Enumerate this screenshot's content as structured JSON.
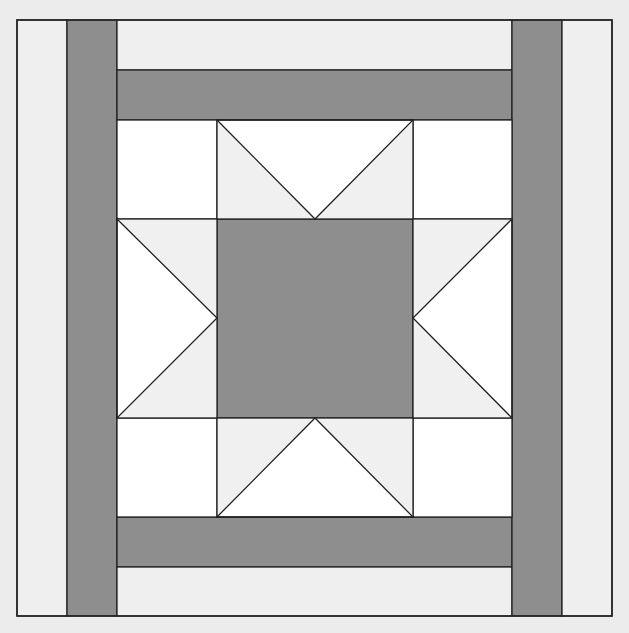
{
  "diagram": {
    "colors": {
      "page_background": "#ececec",
      "light_strip": "#efefef",
      "dark": "#8e8e8e",
      "white": "#ffffff",
      "star_point_light": "#f0f0f0",
      "outline": "#222222"
    },
    "block": {
      "x": 17,
      "y": 20,
      "width": 595,
      "height": 596
    },
    "strips": [
      {
        "name": "outer-left-light-strip",
        "x": 17,
        "y": 20,
        "w": 50,
        "h": 596,
        "fill": "light_strip"
      },
      {
        "name": "left-dark-strip",
        "x": 67,
        "y": 20,
        "w": 50,
        "h": 596,
        "fill": "dark"
      },
      {
        "name": "top-light-strip",
        "x": 117,
        "y": 20,
        "w": 395,
        "h": 50,
        "fill": "light_strip"
      },
      {
        "name": "top-dark-strip",
        "x": 117,
        "y": 70,
        "w": 395,
        "h": 50,
        "fill": "dark"
      },
      {
        "name": "bottom-dark-strip",
        "x": 117,
        "y": 517,
        "w": 395,
        "h": 50,
        "fill": "dark"
      },
      {
        "name": "bottom-light-strip",
        "x": 117,
        "y": 567,
        "w": 395,
        "h": 49,
        "fill": "light_strip"
      },
      {
        "name": "right-dark-strip",
        "x": 512,
        "y": 20,
        "w": 50,
        "h": 596,
        "fill": "dark"
      },
      {
        "name": "outer-right-light-strip",
        "x": 562,
        "y": 20,
        "w": 50,
        "h": 596,
        "fill": "light_strip"
      }
    ],
    "star": {
      "corner_squares": [
        {
          "name": "corner-square-top-left",
          "x": 117,
          "y": 120,
          "w": 100,
          "h": 99
        },
        {
          "name": "corner-square-top-right",
          "x": 413,
          "y": 120,
          "w": 99,
          "h": 99
        },
        {
          "name": "corner-square-bottom-left",
          "x": 117,
          "y": 418,
          "w": 100,
          "h": 99
        },
        {
          "name": "corner-square-bottom-right",
          "x": 413,
          "y": 418,
          "w": 99,
          "h": 99
        }
      ],
      "center_square": {
        "name": "center-square",
        "x": 217,
        "y": 219,
        "w": 196,
        "h": 199
      },
      "flying_geese": [
        {
          "name": "star-point-top",
          "x": 217,
          "y": 120,
          "w": 196,
          "h": 99,
          "apex": [
            315,
            219
          ],
          "base_side": "top"
        },
        {
          "name": "star-point-bottom",
          "x": 217,
          "y": 418,
          "w": 196,
          "h": 99,
          "apex": [
            315,
            418
          ],
          "base_side": "bottom"
        },
        {
          "name": "star-point-left",
          "x": 117,
          "y": 219,
          "w": 100,
          "h": 199,
          "apex": [
            217,
            318
          ],
          "base_side": "left"
        },
        {
          "name": "star-point-right",
          "x": 413,
          "y": 219,
          "w": 99,
          "h": 199,
          "apex": [
            413,
            318
          ],
          "base_side": "right"
        }
      ]
    }
  }
}
